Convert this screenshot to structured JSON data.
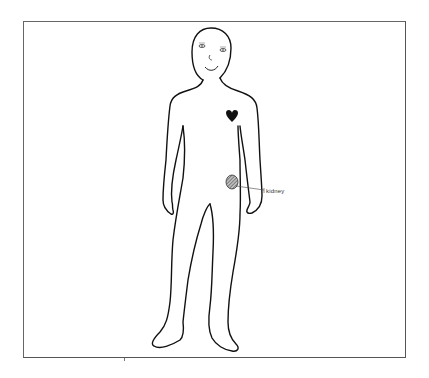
{
  "figure": {
    "organs": [
      {
        "name": "heart",
        "label": "",
        "color": "#111111"
      },
      {
        "name": "kidney",
        "label": "kidney",
        "color": "#666666"
      }
    ]
  },
  "colors": {
    "outline": "#111111",
    "frame": "#555555",
    "background": "#ffffff"
  }
}
